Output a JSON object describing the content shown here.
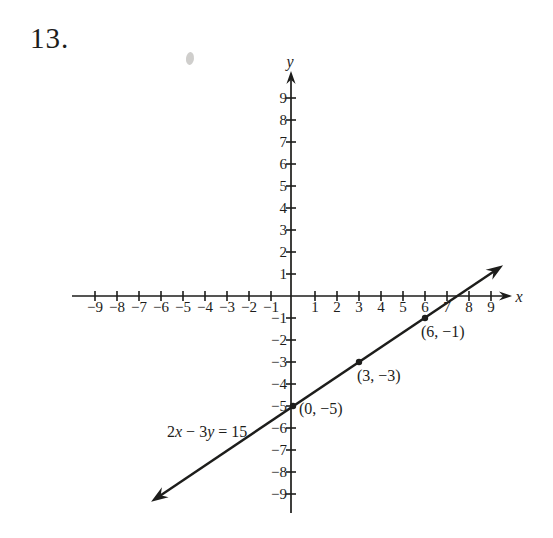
{
  "page": {
    "problem_number": "13.",
    "background": "#ffffff",
    "ink": "#1d1d1b"
  },
  "chart_data": {
    "type": "line",
    "title": "",
    "equation_label": "2x − 3y = 15",
    "xlabel": "x",
    "ylabel": "y",
    "xlim": [
      -10,
      10
    ],
    "ylim": [
      -10,
      10
    ],
    "grid": false,
    "ticks": [
      -9,
      -8,
      -7,
      -6,
      -5,
      -4,
      -3,
      -2,
      -1,
      1,
      2,
      3,
      4,
      5,
      6,
      7,
      8,
      9
    ],
    "x_tick_labels": [
      "−9",
      "−8",
      "−7",
      "−6",
      "−5",
      "−4",
      "−3",
      "−2",
      "−1",
      "1",
      "2",
      "3",
      "4",
      "5",
      "6",
      "7",
      "8",
      "9"
    ],
    "y_tick_labels": [
      "−9",
      "−8",
      "−7",
      "−6",
      "−5",
      "−4",
      "−3",
      "−2",
      "−1",
      "1",
      "2",
      "3",
      "4",
      "5",
      "6",
      "7",
      "8",
      "9"
    ],
    "line": {
      "slope_numerator": 2,
      "slope_denominator": 3,
      "y_intercept": -5,
      "x_intercept": 7.5,
      "endpoints": [
        [
          -6.45,
          -9.35
        ],
        [
          9.55,
          1.4
        ]
      ]
    },
    "points": [
      {
        "x": 0,
        "y": -5,
        "label": "(0, −5)"
      },
      {
        "x": 3,
        "y": -3,
        "label": "(3, −3)"
      },
      {
        "x": 6,
        "y": -1,
        "label": "(6, −1)"
      }
    ]
  }
}
